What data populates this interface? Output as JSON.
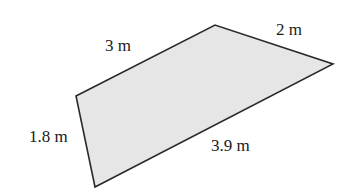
{
  "figure": {
    "shape": "quadrilateral",
    "fill_color": "#e6e6e6",
    "stroke_color": "#2a2a2a",
    "vertices": [
      [
        76,
        96
      ],
      [
        215,
        25
      ],
      [
        333,
        64
      ],
      [
        95,
        187
      ]
    ],
    "sides": {
      "top_left": "3 m",
      "top_right": "2 m",
      "bottom": "3.9 m",
      "left": "1.8 m"
    }
  }
}
